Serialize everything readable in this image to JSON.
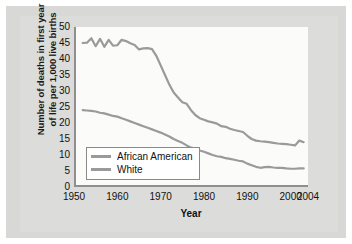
{
  "chart_data": {
    "type": "line",
    "title": "",
    "xlabel": "Year",
    "ylabel_line1": "Number of deaths in first year",
    "ylabel_line2": "of life per 1,000 live births",
    "xlim": [
      1950,
      2004
    ],
    "ylim": [
      0,
      50
    ],
    "grid": false,
    "legend_position": "lower-left",
    "xticks": [
      1950,
      1960,
      1970,
      1980,
      1990,
      2000,
      2004
    ],
    "xtick_labels": [
      "1950",
      "1960",
      "1970",
      "1980",
      "1990",
      "2000",
      "2004"
    ],
    "yticks": [
      0,
      5,
      10,
      15,
      20,
      25,
      30,
      35,
      40,
      45,
      50
    ],
    "ytick_labels": [
      "0",
      "5",
      "10",
      "15",
      "20",
      "25",
      "30",
      "35",
      "40",
      "45",
      "50"
    ],
    "line_color": "#9a9a9a",
    "series": [
      {
        "name": "African American",
        "color": "#9a9a9a",
        "x": [
          1952,
          1953,
          1954,
          1955,
          1956,
          1957,
          1958,
          1959,
          1960,
          1961,
          1962,
          1963,
          1964,
          1965,
          1966,
          1967,
          1968,
          1969,
          1970,
          1971,
          1972,
          1973,
          1974,
          1975,
          1976,
          1977,
          1978,
          1979,
          1980,
          1981,
          1982,
          1983,
          1984,
          1985,
          1986,
          1987,
          1988,
          1989,
          1990,
          1991,
          1992,
          1993,
          1994,
          1995,
          1996,
          1997,
          1998,
          1999,
          2000,
          2001,
          2002,
          2003
        ],
        "values": [
          45.0,
          45.1,
          46.5,
          44.0,
          46.3,
          43.8,
          46.0,
          44.2,
          44.3,
          46.0,
          45.6,
          44.9,
          44.4,
          43.0,
          43.3,
          43.4,
          43.1,
          41.0,
          38.0,
          35.0,
          32.0,
          29.5,
          28.0,
          26.5,
          26.0,
          24.0,
          22.5,
          21.5,
          21.0,
          20.5,
          20.2,
          19.8,
          19.0,
          18.8,
          18.2,
          17.8,
          17.5,
          17.2,
          16.0,
          15.0,
          14.5,
          14.3,
          14.2,
          14.0,
          13.8,
          13.6,
          13.5,
          13.4,
          13.2,
          13.0,
          14.5,
          14.0
        ]
      },
      {
        "name": "White",
        "color": "#9a9a9a",
        "x": [
          1952,
          1953,
          1954,
          1955,
          1956,
          1957,
          1958,
          1959,
          1960,
          1961,
          1962,
          1963,
          1964,
          1965,
          1966,
          1967,
          1968,
          1969,
          1970,
          1971,
          1972,
          1973,
          1974,
          1975,
          1976,
          1977,
          1978,
          1979,
          1980,
          1981,
          1982,
          1983,
          1984,
          1985,
          1986,
          1987,
          1988,
          1989,
          1990,
          1991,
          1992,
          1993,
          1994,
          1995,
          1996,
          1997,
          1998,
          1999,
          2000,
          2001,
          2002,
          2003
        ],
        "values": [
          24.0,
          23.9,
          23.8,
          23.6,
          23.2,
          23.0,
          22.6,
          22.2,
          22.0,
          21.5,
          21.0,
          20.5,
          20.0,
          19.5,
          19.0,
          18.5,
          18.0,
          17.5,
          17.0,
          16.4,
          15.8,
          15.0,
          14.4,
          13.8,
          13.0,
          12.3,
          12.0,
          11.4,
          11.0,
          10.5,
          10.0,
          9.6,
          9.4,
          9.0,
          8.8,
          8.5,
          8.2,
          8.0,
          7.3,
          6.8,
          6.3,
          6.0,
          6.2,
          6.3,
          6.1,
          6.0,
          6.0,
          5.8,
          5.7,
          5.7,
          5.8,
          5.8
        ]
      }
    ],
    "legend": [
      "African American",
      "White"
    ]
  }
}
